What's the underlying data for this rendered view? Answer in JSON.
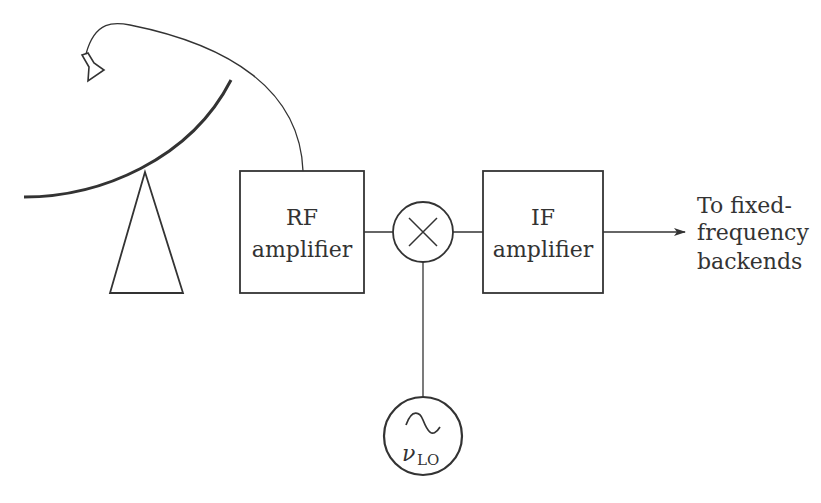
{
  "diagram": {
    "type": "heterodyne receiver block diagram",
    "colors": {
      "stroke": "#333333",
      "background": "#ffffff",
      "text": "#333333"
    },
    "antenna": {
      "components": [
        "parabolic-dish",
        "feed-horn",
        "pedestal",
        "feed-cable"
      ]
    },
    "blocks": [
      {
        "id": "rf",
        "line1": "RF",
        "line2": "amplifier"
      },
      {
        "id": "if",
        "line1": "IF",
        "line2": "amplifier"
      }
    ],
    "mixer": {
      "symbol": "×"
    },
    "local_oscillator": {
      "symbol": "~",
      "label_main": "ν",
      "label_sub": "LO"
    },
    "output": {
      "line1": "To fixed-",
      "line2": "frequency",
      "line3": "backends"
    }
  }
}
